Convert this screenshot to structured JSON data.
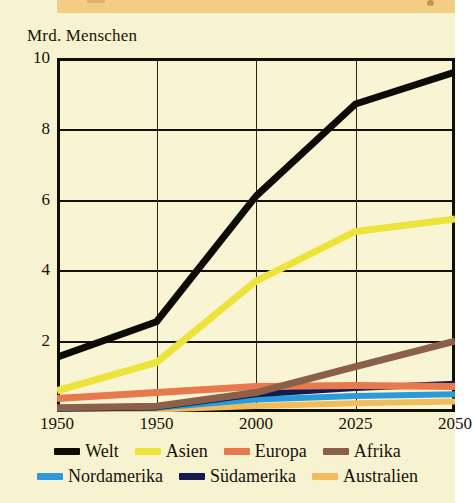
{
  "chart_data": {
    "type": "line",
    "title": "",
    "ylabel": "Mrd. Menschen",
    "xlabel": "",
    "ylim": [
      0,
      10
    ],
    "yticks": [
      10,
      8,
      6,
      4,
      2
    ],
    "xticks": [
      "1950",
      "1950",
      "2000",
      "2025",
      "2050"
    ],
    "xtick_values": [
      1950,
      1950,
      2000,
      2025,
      2050
    ],
    "x": [
      1950,
      1975,
      2000,
      2025,
      2050
    ],
    "grid": "both",
    "legend_position": "bottom",
    "series": [
      {
        "name": "Welt",
        "color": "#0d0b06",
        "values": [
          1.55,
          2.55,
          6.1,
          8.7,
          9.6
        ]
      },
      {
        "name": "Asien",
        "color": "#ece43c",
        "values": [
          0.6,
          1.4,
          3.7,
          5.1,
          5.45
        ]
      },
      {
        "name": "Europa",
        "color": "#e8784e",
        "values": [
          0.38,
          0.55,
          0.72,
          0.75,
          0.72
        ]
      },
      {
        "name": "Afrika",
        "color": "#8a6048",
        "values": [
          0.12,
          0.16,
          0.55,
          1.28,
          2.0
        ]
      },
      {
        "name": "Nordamerika",
        "color": "#2b9ada",
        "values": [
          0.1,
          0.12,
          0.35,
          0.45,
          0.5
        ]
      },
      {
        "name": "Südamerika",
        "color": "#131a52",
        "values": [
          0.09,
          0.13,
          0.5,
          0.68,
          0.8
        ]
      },
      {
        "name": "Australien",
        "color": "#f0bc5e",
        "values": [
          0.05,
          0.07,
          0.17,
          0.25,
          0.3
        ]
      }
    ]
  },
  "axis": {
    "y_title": "Mrd. Menschen",
    "y_ticks": [
      "10",
      "8",
      "6",
      "4",
      "2"
    ],
    "x_ticks": [
      "1950",
      "1950",
      "2000",
      "2025",
      "2050"
    ]
  },
  "legend": {
    "row1": [
      {
        "label": "Welt",
        "color": "#0d0b06"
      },
      {
        "label": "Asien",
        "color": "#ece43c"
      },
      {
        "label": "Europa",
        "color": "#e8784e"
      },
      {
        "label": "Afrika",
        "color": "#8a6048"
      }
    ],
    "row2": [
      {
        "label": "Nordamerika",
        "color": "#2b9ada"
      },
      {
        "label": "Südamerika",
        "color": "#131a52"
      },
      {
        "label": "Australien",
        "color": "#f0bc5e"
      }
    ]
  },
  "colors": {
    "paper": "#f7f2cf",
    "plot_bg": "#f9f5d4",
    "top_band": "#f2cd84",
    "frame": "#111008",
    "text": "#19130a"
  }
}
